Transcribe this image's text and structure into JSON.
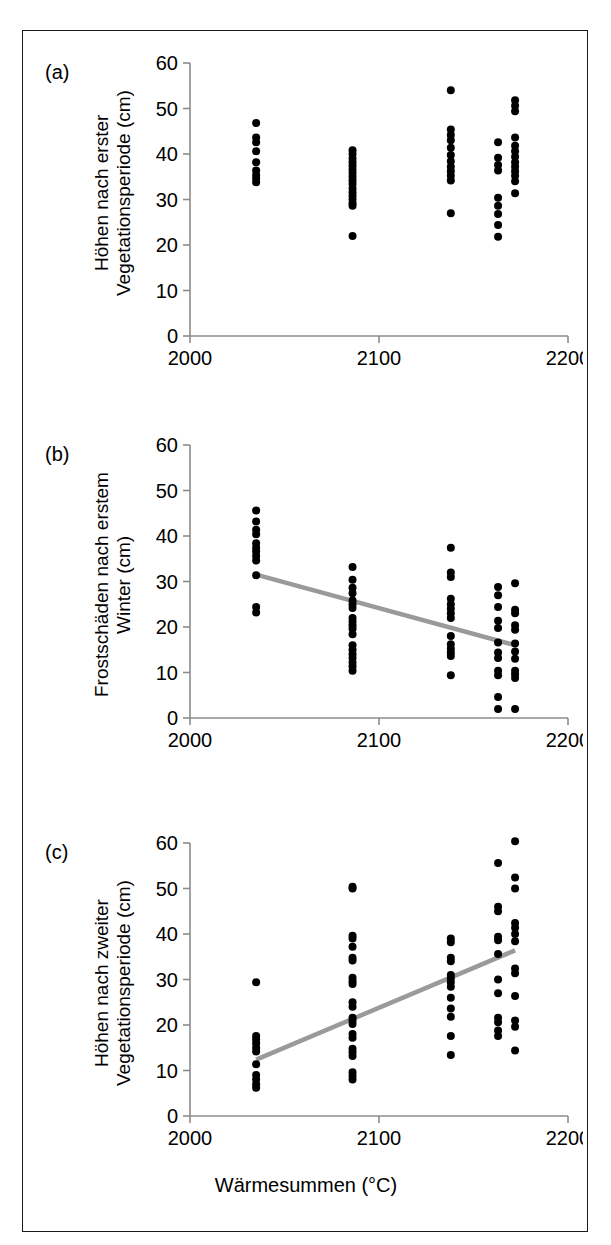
{
  "figure": {
    "xlabel": "Wärmesummen (°C)",
    "axis_color": "#8c8c8c",
    "point_color": "#000000",
    "fit_color": "#9a9a9a",
    "frame_color": "#1a1a1a"
  },
  "panels": [
    {
      "label": "(a)",
      "ylabel": "Höhen nach erster\nVegetationsperiode (cm)"
    },
    {
      "label": "(b)",
      "ylabel": "Frostschäden nach erstem\nWinter (cm)"
    },
    {
      "label": "(c)",
      "ylabel": "Höhen nach zweiter\nVegetationsperiode (cm)"
    }
  ],
  "chart_data": [
    {
      "type": "scatter",
      "panel": "(a)",
      "title": "",
      "xlabel": "Wärmesummen (°C)",
      "ylabel": "Höhen nach erster Vegetationsperiode (cm)",
      "xlim": [
        2000,
        2200
      ],
      "ylim": [
        0,
        60
      ],
      "xticks": [
        2000,
        2100,
        2200
      ],
      "yticks": [
        0,
        10,
        20,
        30,
        40,
        50,
        60
      ],
      "xticklabels": [
        "2000",
        "2100",
        "2200"
      ],
      "yticklabels": [
        "0",
        "10",
        "20",
        "30",
        "40",
        "50",
        "60"
      ],
      "grid": false,
      "legend": "none",
      "trendline": null,
      "points": [
        {
          "x": 2035,
          "y": 46.8
        },
        {
          "x": 2035,
          "y": 43.6
        },
        {
          "x": 2035,
          "y": 42.6
        },
        {
          "x": 2035,
          "y": 40.6
        },
        {
          "x": 2035,
          "y": 38.2
        },
        {
          "x": 2035,
          "y": 36.4
        },
        {
          "x": 2035,
          "y": 35.4
        },
        {
          "x": 2035,
          "y": 34.6
        },
        {
          "x": 2035,
          "y": 33.8
        },
        {
          "x": 2086,
          "y": 40.8
        },
        {
          "x": 2086,
          "y": 40.0
        },
        {
          "x": 2086,
          "y": 39.0
        },
        {
          "x": 2086,
          "y": 38.2
        },
        {
          "x": 2086,
          "y": 37.4
        },
        {
          "x": 2086,
          "y": 36.6
        },
        {
          "x": 2086,
          "y": 35.8
        },
        {
          "x": 2086,
          "y": 35.0
        },
        {
          "x": 2086,
          "y": 34.2
        },
        {
          "x": 2086,
          "y": 33.4
        },
        {
          "x": 2086,
          "y": 32.4
        },
        {
          "x": 2086,
          "y": 31.6
        },
        {
          "x": 2086,
          "y": 30.8
        },
        {
          "x": 2086,
          "y": 30.0
        },
        {
          "x": 2086,
          "y": 29.2
        },
        {
          "x": 2086,
          "y": 28.6
        },
        {
          "x": 2086,
          "y": 22.0
        },
        {
          "x": 2138,
          "y": 54.0
        },
        {
          "x": 2138,
          "y": 45.4
        },
        {
          "x": 2138,
          "y": 44.2
        },
        {
          "x": 2138,
          "y": 43.0
        },
        {
          "x": 2138,
          "y": 41.4
        },
        {
          "x": 2138,
          "y": 39.8
        },
        {
          "x": 2138,
          "y": 38.4
        },
        {
          "x": 2138,
          "y": 37.2
        },
        {
          "x": 2138,
          "y": 36.2
        },
        {
          "x": 2138,
          "y": 35.2
        },
        {
          "x": 2138,
          "y": 34.2
        },
        {
          "x": 2138,
          "y": 27.0
        },
        {
          "x": 2163,
          "y": 42.6
        },
        {
          "x": 2163,
          "y": 39.2
        },
        {
          "x": 2163,
          "y": 37.6
        },
        {
          "x": 2163,
          "y": 36.4
        },
        {
          "x": 2163,
          "y": 30.4
        },
        {
          "x": 2163,
          "y": 28.6
        },
        {
          "x": 2163,
          "y": 26.8
        },
        {
          "x": 2163,
          "y": 24.4
        },
        {
          "x": 2163,
          "y": 21.8
        },
        {
          "x": 2172,
          "y": 51.8
        },
        {
          "x": 2172,
          "y": 50.6
        },
        {
          "x": 2172,
          "y": 49.4
        },
        {
          "x": 2172,
          "y": 43.6
        },
        {
          "x": 2172,
          "y": 41.8
        },
        {
          "x": 2172,
          "y": 40.6
        },
        {
          "x": 2172,
          "y": 39.4
        },
        {
          "x": 2172,
          "y": 38.2
        },
        {
          "x": 2172,
          "y": 37.2
        },
        {
          "x": 2172,
          "y": 36.2
        },
        {
          "x": 2172,
          "y": 35.2
        },
        {
          "x": 2172,
          "y": 34.0
        },
        {
          "x": 2172,
          "y": 31.4
        }
      ]
    },
    {
      "type": "scatter",
      "panel": "(b)",
      "title": "",
      "xlabel": "Wärmesummen (°C)",
      "ylabel": "Frostschäden nach erstem Winter (cm)",
      "xlim": [
        2000,
        2200
      ],
      "ylim": [
        0,
        60
      ],
      "xticks": [
        2000,
        2100,
        2200
      ],
      "yticks": [
        0,
        10,
        20,
        30,
        40,
        50,
        60
      ],
      "xticklabels": [
        "2000",
        "2100",
        "2200"
      ],
      "yticklabels": [
        "0",
        "10",
        "20",
        "30",
        "40",
        "50",
        "60"
      ],
      "grid": false,
      "legend": "none",
      "trendline": {
        "x0": 2035,
        "y0": 31.5,
        "x1": 2172,
        "y1": 16.0
      },
      "points": [
        {
          "x": 2035,
          "y": 45.6
        },
        {
          "x": 2035,
          "y": 43.2
        },
        {
          "x": 2035,
          "y": 41.4
        },
        {
          "x": 2035,
          "y": 40.4
        },
        {
          "x": 2035,
          "y": 38.4
        },
        {
          "x": 2035,
          "y": 37.4
        },
        {
          "x": 2035,
          "y": 36.6
        },
        {
          "x": 2035,
          "y": 35.6
        },
        {
          "x": 2035,
          "y": 34.6
        },
        {
          "x": 2035,
          "y": 31.4
        },
        {
          "x": 2035,
          "y": 24.4
        },
        {
          "x": 2035,
          "y": 23.2
        },
        {
          "x": 2086,
          "y": 33.2
        },
        {
          "x": 2086,
          "y": 30.4
        },
        {
          "x": 2086,
          "y": 28.6
        },
        {
          "x": 2086,
          "y": 27.4
        },
        {
          "x": 2086,
          "y": 25.8
        },
        {
          "x": 2086,
          "y": 25.0
        },
        {
          "x": 2086,
          "y": 24.2
        },
        {
          "x": 2086,
          "y": 22.0
        },
        {
          "x": 2086,
          "y": 21.2
        },
        {
          "x": 2086,
          "y": 20.4
        },
        {
          "x": 2086,
          "y": 19.6
        },
        {
          "x": 2086,
          "y": 18.4
        },
        {
          "x": 2086,
          "y": 16.0
        },
        {
          "x": 2086,
          "y": 15.0
        },
        {
          "x": 2086,
          "y": 14.0
        },
        {
          "x": 2086,
          "y": 13.2
        },
        {
          "x": 2086,
          "y": 12.2
        },
        {
          "x": 2086,
          "y": 11.4
        },
        {
          "x": 2086,
          "y": 10.4
        },
        {
          "x": 2138,
          "y": 37.4
        },
        {
          "x": 2138,
          "y": 32.0
        },
        {
          "x": 2138,
          "y": 31.0
        },
        {
          "x": 2138,
          "y": 26.2
        },
        {
          "x": 2138,
          "y": 25.0
        },
        {
          "x": 2138,
          "y": 24.0
        },
        {
          "x": 2138,
          "y": 23.0
        },
        {
          "x": 2138,
          "y": 22.0
        },
        {
          "x": 2138,
          "y": 18.0
        },
        {
          "x": 2138,
          "y": 16.2
        },
        {
          "x": 2138,
          "y": 15.2
        },
        {
          "x": 2138,
          "y": 14.4
        },
        {
          "x": 2138,
          "y": 13.6
        },
        {
          "x": 2138,
          "y": 9.4
        },
        {
          "x": 2163,
          "y": 28.8
        },
        {
          "x": 2163,
          "y": 27.0
        },
        {
          "x": 2163,
          "y": 24.4
        },
        {
          "x": 2163,
          "y": 21.4
        },
        {
          "x": 2163,
          "y": 19.8
        },
        {
          "x": 2163,
          "y": 16.6
        },
        {
          "x": 2163,
          "y": 14.4
        },
        {
          "x": 2163,
          "y": 13.2
        },
        {
          "x": 2163,
          "y": 10.4
        },
        {
          "x": 2163,
          "y": 9.4
        },
        {
          "x": 2163,
          "y": 4.6
        },
        {
          "x": 2163,
          "y": 2.0
        },
        {
          "x": 2172,
          "y": 29.6
        },
        {
          "x": 2172,
          "y": 23.8
        },
        {
          "x": 2172,
          "y": 23.0
        },
        {
          "x": 2172,
          "y": 20.4
        },
        {
          "x": 2172,
          "y": 19.4
        },
        {
          "x": 2172,
          "y": 16.4
        },
        {
          "x": 2172,
          "y": 14.6
        },
        {
          "x": 2172,
          "y": 13.0
        },
        {
          "x": 2172,
          "y": 10.4
        },
        {
          "x": 2172,
          "y": 9.6
        },
        {
          "x": 2172,
          "y": 8.8
        },
        {
          "x": 2172,
          "y": 2.0
        }
      ]
    },
    {
      "type": "scatter",
      "panel": "(c)",
      "title": "",
      "xlabel": "Wärmesummen (°C)",
      "ylabel": "Höhen nach zweiter Vegetationsperiode (cm)",
      "xlim": [
        2000,
        2200
      ],
      "ylim": [
        0,
        60
      ],
      "xticks": [
        2000,
        2100,
        2200
      ],
      "yticks": [
        0,
        10,
        20,
        30,
        40,
        50,
        60
      ],
      "xticklabels": [
        "2000",
        "2100",
        "2200"
      ],
      "yticklabels": [
        "0",
        "10",
        "20",
        "30",
        "40",
        "50",
        "60"
      ],
      "grid": false,
      "legend": "none",
      "trendline": {
        "x0": 2035,
        "y0": 12.4,
        "x1": 2172,
        "y1": 36.4
      },
      "points": [
        {
          "x": 2035,
          "y": 29.4
        },
        {
          "x": 2035,
          "y": 17.6
        },
        {
          "x": 2035,
          "y": 16.8
        },
        {
          "x": 2035,
          "y": 16.0
        },
        {
          "x": 2035,
          "y": 15.0
        },
        {
          "x": 2035,
          "y": 14.2
        },
        {
          "x": 2035,
          "y": 11.4
        },
        {
          "x": 2035,
          "y": 9.0
        },
        {
          "x": 2035,
          "y": 8.0
        },
        {
          "x": 2035,
          "y": 7.0
        },
        {
          "x": 2035,
          "y": 6.2
        },
        {
          "x": 2086,
          "y": 50.4
        },
        {
          "x": 2086,
          "y": 50.0
        },
        {
          "x": 2086,
          "y": 39.6
        },
        {
          "x": 2086,
          "y": 39.0
        },
        {
          "x": 2086,
          "y": 37.2
        },
        {
          "x": 2086,
          "y": 34.8
        },
        {
          "x": 2086,
          "y": 34.2
        },
        {
          "x": 2086,
          "y": 30.4
        },
        {
          "x": 2086,
          "y": 29.6
        },
        {
          "x": 2086,
          "y": 29.0
        },
        {
          "x": 2086,
          "y": 25.0
        },
        {
          "x": 2086,
          "y": 24.0
        },
        {
          "x": 2086,
          "y": 21.6
        },
        {
          "x": 2086,
          "y": 21.0
        },
        {
          "x": 2086,
          "y": 20.2
        },
        {
          "x": 2086,
          "y": 18.0
        },
        {
          "x": 2086,
          "y": 17.2
        },
        {
          "x": 2086,
          "y": 14.8
        },
        {
          "x": 2086,
          "y": 14.0
        },
        {
          "x": 2086,
          "y": 13.2
        },
        {
          "x": 2086,
          "y": 9.6
        },
        {
          "x": 2086,
          "y": 8.8
        },
        {
          "x": 2086,
          "y": 8.0
        },
        {
          "x": 2138,
          "y": 39.0
        },
        {
          "x": 2138,
          "y": 38.2
        },
        {
          "x": 2138,
          "y": 34.8
        },
        {
          "x": 2138,
          "y": 34.0
        },
        {
          "x": 2138,
          "y": 31.0
        },
        {
          "x": 2138,
          "y": 30.2
        },
        {
          "x": 2138,
          "y": 29.4
        },
        {
          "x": 2138,
          "y": 28.4
        },
        {
          "x": 2138,
          "y": 26.0
        },
        {
          "x": 2138,
          "y": 23.6
        },
        {
          "x": 2138,
          "y": 21.8
        },
        {
          "x": 2138,
          "y": 17.6
        },
        {
          "x": 2138,
          "y": 13.4
        },
        {
          "x": 2163,
          "y": 55.6
        },
        {
          "x": 2163,
          "y": 46.0
        },
        {
          "x": 2163,
          "y": 45.0
        },
        {
          "x": 2163,
          "y": 39.4
        },
        {
          "x": 2163,
          "y": 38.6
        },
        {
          "x": 2163,
          "y": 35.6
        },
        {
          "x": 2163,
          "y": 30.0
        },
        {
          "x": 2163,
          "y": 27.0
        },
        {
          "x": 2163,
          "y": 21.6
        },
        {
          "x": 2163,
          "y": 20.6
        },
        {
          "x": 2163,
          "y": 18.8
        },
        {
          "x": 2163,
          "y": 17.6
        },
        {
          "x": 2172,
          "y": 60.4
        },
        {
          "x": 2172,
          "y": 52.4
        },
        {
          "x": 2172,
          "y": 50.0
        },
        {
          "x": 2172,
          "y": 42.4
        },
        {
          "x": 2172,
          "y": 41.4
        },
        {
          "x": 2172,
          "y": 40.0
        },
        {
          "x": 2172,
          "y": 38.4
        },
        {
          "x": 2172,
          "y": 32.4
        },
        {
          "x": 2172,
          "y": 31.4
        },
        {
          "x": 2172,
          "y": 26.4
        },
        {
          "x": 2172,
          "y": 21.0
        },
        {
          "x": 2172,
          "y": 19.6
        },
        {
          "x": 2172,
          "y": 14.4
        }
      ]
    }
  ]
}
